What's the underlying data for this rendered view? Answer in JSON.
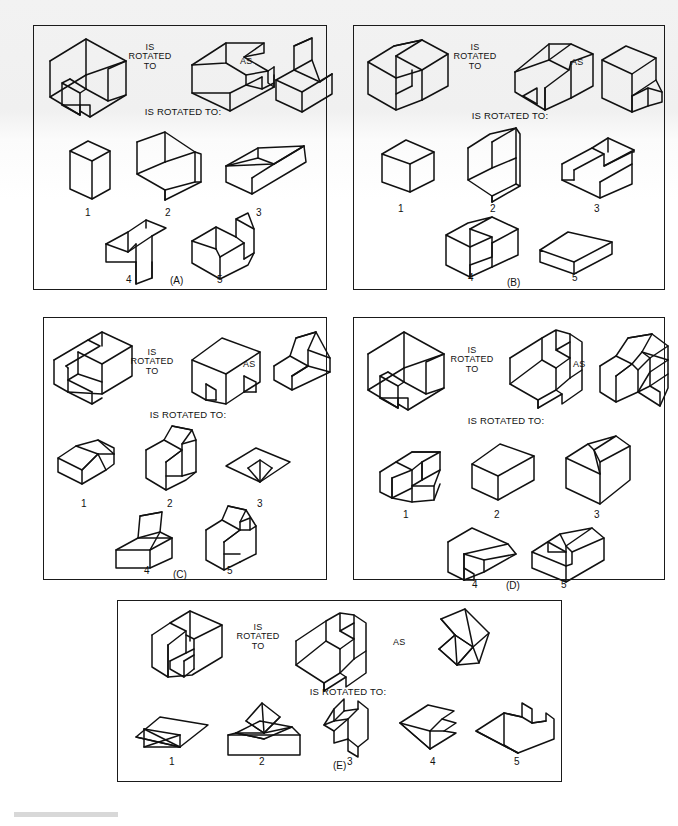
{
  "figure": {
    "kind": "spatial-rotation-test",
    "panel_count": 5,
    "connector_labels": {
      "is_rotated_to": "IS\nROTATED\nTO",
      "as": "AS",
      "prompt": "IS ROTATED TO:"
    },
    "option_numbers": [
      "1",
      "2",
      "3",
      "4",
      "5"
    ]
  },
  "panels": [
    {
      "id": "A",
      "caption": "(A)",
      "stem": {
        "left_label": "IS\nROTATED\nTO",
        "right_label": "AS",
        "prompt": "IS ROTATED TO:"
      },
      "options": [
        {
          "number": "1",
          "shape": "tall-rectangular-prism"
        },
        {
          "number": "2",
          "shape": "open-channel-block-front-notch"
        },
        {
          "number": "3",
          "shape": "flat-slab-with-ledge"
        },
        {
          "number": "4",
          "shape": "stepped-block-with-lower-tab"
        },
        {
          "number": "5",
          "shape": "v-notched-wedge-block"
        }
      ]
    },
    {
      "id": "B",
      "caption": "(B)",
      "stem": {
        "left_label": "IS\nROTATED\nTO",
        "right_label": "AS",
        "prompt": "IS ROTATED TO:"
      },
      "options": [
        {
          "number": "1",
          "shape": "plain-rectangular-box"
        },
        {
          "number": "2",
          "shape": "tall-c-shaped-block"
        },
        {
          "number": "3",
          "shape": "open-tray-with-inner-wall"
        },
        {
          "number": "4",
          "shape": "u-shaped-channel-block"
        },
        {
          "number": "5",
          "shape": "flat-slab"
        }
      ]
    },
    {
      "id": "C",
      "caption": "(C)",
      "stem": {
        "left_label": "IS\nROTATED\nTO",
        "right_label": "AS",
        "prompt": "IS ROTATED TO:"
      },
      "options": [
        {
          "number": "1",
          "shape": "slanted-wedge-on-slab"
        },
        {
          "number": "2",
          "shape": "angled-fin-block"
        },
        {
          "number": "3",
          "shape": "flat-diamond-with-notch"
        },
        {
          "number": "4",
          "shape": "ramp-block-with-base"
        },
        {
          "number": "5",
          "shape": "forked-wedge-block"
        }
      ]
    },
    {
      "id": "D",
      "caption": "(D)",
      "stem": {
        "left_label": "IS\nROTATED\nTO",
        "right_label": "AS",
        "prompt": "IS ROTATED TO:"
      },
      "options": [
        {
          "number": "1",
          "shape": "two-tier-stepped-block"
        },
        {
          "number": "2",
          "shape": "plain-cube"
        },
        {
          "number": "3",
          "shape": "cube-with-split-top"
        },
        {
          "number": "4",
          "shape": "bevelled-block-with-notch"
        },
        {
          "number": "5",
          "shape": "block-with-corner-notch"
        }
      ]
    },
    {
      "id": "E",
      "caption": "(E)",
      "stem": {
        "left_label": "IS\nROTATED\nTO",
        "right_label": "AS",
        "prompt": "IS ROTATED TO:"
      },
      "options": [
        {
          "number": "1",
          "shape": "flat-diamond-with-cross-braces"
        },
        {
          "number": "2",
          "shape": "pyramid-on-slab"
        },
        {
          "number": "3",
          "shape": "zigzag-stepped-profile"
        },
        {
          "number": "4",
          "shape": "arrow-notched-flat-shape"
        },
        {
          "number": "5",
          "shape": "hooked-flat-profile"
        }
      ]
    }
  ]
}
